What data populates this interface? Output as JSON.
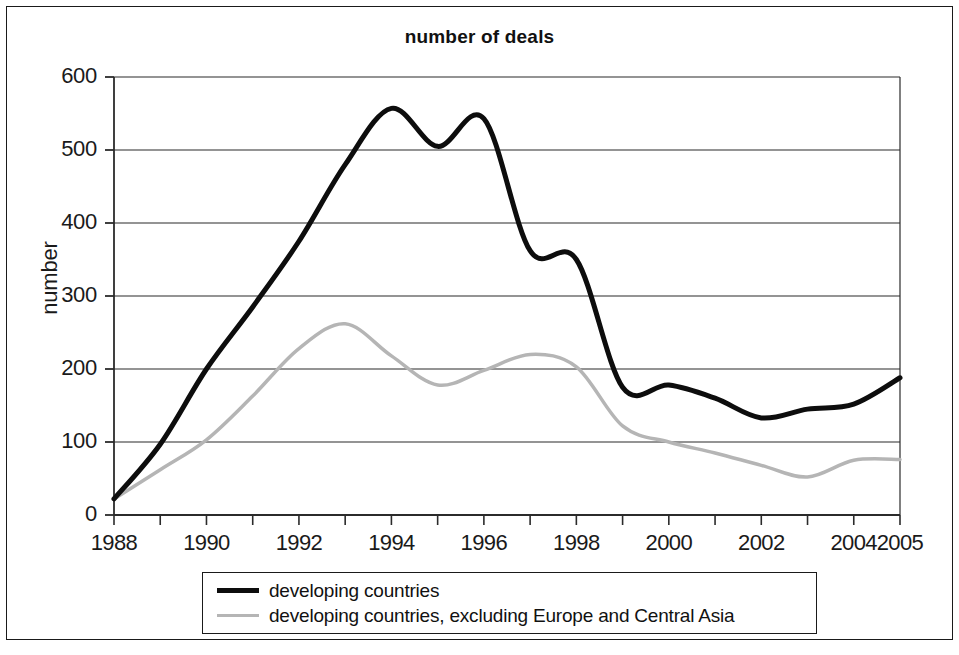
{
  "chart_data": {
    "type": "line",
    "title": "number of deals",
    "xlabel": "",
    "ylabel": "number",
    "xlim": [
      1988,
      2005
    ],
    "ylim": [
      0,
      600
    ],
    "ytick_labels": [
      "600",
      "500",
      "400",
      "300",
      "200",
      "100",
      "0"
    ],
    "ytick_values": [
      600,
      500,
      400,
      300,
      200,
      100,
      0
    ],
    "xtick_labels": [
      "1988",
      "1990",
      "1992",
      "1994",
      "1996",
      "1998",
      "2000",
      "2002",
      "2004",
      "2005"
    ],
    "xtick_values": [
      1988,
      1990,
      1992,
      1994,
      1996,
      1998,
      2000,
      2002,
      2004,
      2005
    ],
    "grid": "horizontal",
    "legend_position": "below-axes",
    "x": [
      1988,
      1989,
      1990,
      1991,
      1992,
      1993,
      1994,
      1995,
      1996,
      1997,
      1998,
      1999,
      2000,
      2001,
      2002,
      2003,
      2004,
      2005
    ],
    "series": [
      {
        "name": "developing countries",
        "color": "#0d0d0d",
        "width": 5,
        "values": [
          22,
          97,
          200,
          285,
          375,
          480,
          557,
          505,
          543,
          362,
          350,
          175,
          178,
          160,
          133,
          145,
          152,
          188
        ]
      },
      {
        "name": "developing countries, excluding Europe and Central Asia",
        "color": "#b5b5b5",
        "width": 3.5,
        "values": [
          22,
          62,
          103,
          163,
          228,
          262,
          218,
          178,
          198,
          220,
          203,
          122,
          100,
          85,
          68,
          52,
          75,
          76
        ]
      }
    ]
  },
  "legend": {
    "entries": [
      {
        "label": "developing countries",
        "swatch": "black"
      },
      {
        "label": "developing countries, excluding Europe and Central Asia",
        "swatch": "gray"
      }
    ]
  }
}
